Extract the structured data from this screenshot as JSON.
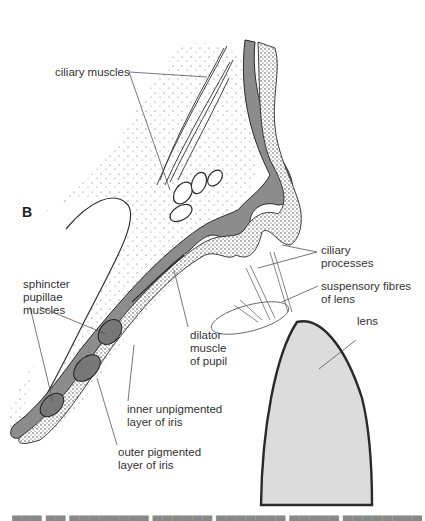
{
  "figure": {
    "panel_label": "B",
    "colors": {
      "pigment_layer": "#8c8c8c",
      "lens_fill": "#dcdcdc",
      "outline": "#2a2a2a",
      "label_text": "#333333"
    },
    "labels": {
      "ciliary_muscles": "ciliary muscles",
      "ciliary_processes": [
        "ciliary",
        "processes"
      ],
      "suspensory_fibres": [
        "suspensory fibres",
        "of lens"
      ],
      "lens": "lens",
      "sphincter": [
        "sphincter",
        "pupillae",
        "muscles"
      ],
      "dilator": [
        "dilator",
        "muscle",
        "of pupil"
      ],
      "inner_layer": [
        "inner unpigmented",
        "layer of iris"
      ],
      "outer_layer": [
        "outer pigmented",
        "layer of iris"
      ]
    }
  }
}
